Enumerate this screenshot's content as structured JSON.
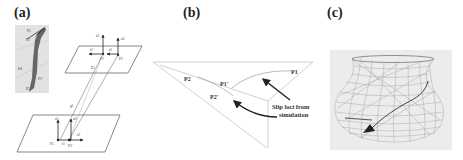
{
  "figure": {
    "panels": [
      {
        "id": "a",
        "label": "(a)",
        "inset_labels": [
          "P1",
          "P2'",
          "Pd",
          "P2",
          "P1'"
        ],
        "upper_plane": {
          "label": "Σ1",
          "points": [
            "P1'",
            "P2"
          ],
          "vectors": [
            "n1",
            "n2",
            "t1'",
            "t2"
          ]
        },
        "lower_plane": {
          "label": "Σ2",
          "points": [
            "P1",
            "P2'"
          ],
          "vectors": [
            "n1",
            "n2'",
            "t1",
            "t2'"
          ]
        },
        "connector_label": "g1"
      },
      {
        "id": "b",
        "label": "(b)",
        "point_labels": {
          "p2": "P2",
          "p1_prime": "P1'",
          "p2_prime": "P2'",
          "p1": "P1"
        },
        "annotation_line1": "Slip loci from",
        "annotation_line2": "simulation"
      },
      {
        "id": "c",
        "label": "(c)",
        "description": "wireframe vase mesh with slip trajectory arrow"
      }
    ],
    "colors": {
      "line": "#555555",
      "light_line": "#bbbbbb",
      "inset_bg": "#e4e4e4",
      "mesh_bg": "#ececec",
      "mesh_line": "#9a9a9a",
      "arrow": "#333333"
    }
  }
}
